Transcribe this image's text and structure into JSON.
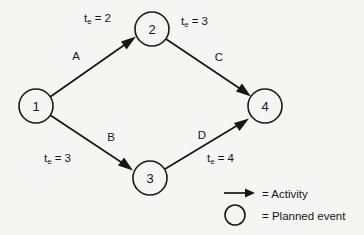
{
  "diagram": {
    "background_color": "#f5f5f4",
    "ink_color": "#161616",
    "nodes": [
      {
        "id": "1",
        "label": "1",
        "name": "event-node-1",
        "cx": 36,
        "cy": 106,
        "r": 17
      },
      {
        "id": "2",
        "label": "2",
        "name": "event-node-2",
        "cx": 152,
        "cy": 29,
        "r": 17
      },
      {
        "id": "3",
        "label": "3",
        "name": "event-node-3",
        "cx": 150,
        "cy": 178,
        "r": 17
      },
      {
        "id": "4",
        "label": "4",
        "name": "event-node-4",
        "cx": 265,
        "cy": 106,
        "r": 17
      }
    ],
    "edges": [
      {
        "id": "A",
        "name": "activity-edge-a",
        "from": "1",
        "to": "2",
        "activity_label": "A",
        "activity_label_x": 76,
        "activity_label_y": 56,
        "te_text": "t",
        "te_sub": "e",
        "te_value": "= 2",
        "te_label_x": 84,
        "te_label_y": 18
      },
      {
        "id": "C",
        "name": "activity-edge-c",
        "from": "2",
        "to": "4",
        "activity_label": "C",
        "activity_label_x": 219,
        "activity_label_y": 57,
        "te_text": "t",
        "te_sub": "e",
        "te_value": "= 3",
        "te_label_x": 181,
        "te_label_y": 21
      },
      {
        "id": "B",
        "name": "activity-edge-b",
        "from": "1",
        "to": "3",
        "activity_label": "B",
        "activity_label_x": 111,
        "activity_label_y": 137,
        "te_text": "t",
        "te_sub": "e",
        "te_value": "= 3",
        "te_label_x": 44,
        "te_label_y": 158
      },
      {
        "id": "D",
        "name": "activity-edge-d",
        "from": "3",
        "to": "4",
        "activity_label": "D",
        "activity_label_x": 202,
        "activity_label_y": 135,
        "te_text": "t",
        "te_sub": "e",
        "te_value": "= 4",
        "te_label_x": 207,
        "te_label_y": 158
      }
    ]
  },
  "legend": {
    "name": "diagram-legend",
    "items": [
      {
        "symbol": "arrow",
        "icon_name": "arrow-right-icon",
        "text": "= Activity"
      },
      {
        "symbol": "circle",
        "icon_name": "circle-outline-icon",
        "text": "= Planned event"
      }
    ]
  }
}
